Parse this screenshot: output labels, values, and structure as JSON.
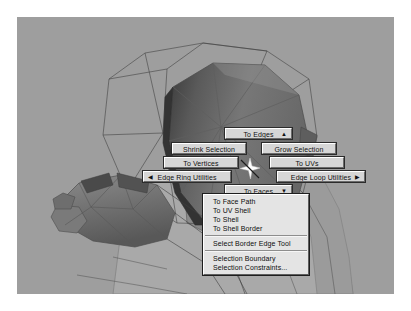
{
  "app": {
    "name": "Maya 3D Viewport",
    "viewport": {
      "background_color": "#9e9e9e",
      "model_description": "shaded polygon head and arm mesh with wireframe cage",
      "mesh_color": "#6e6e6e",
      "wire_color": "#3a3a3a"
    }
  },
  "marking_menu": {
    "title": "Edge marking menu",
    "center_cursor_icon": "sparkle-cursor-icon",
    "buttons": [
      {
        "id": "to-edges",
        "label": "To Edges",
        "arrow": "▲",
        "arrow_side": "right"
      },
      {
        "id": "shrink",
        "label": "Shrink Selection",
        "arrow": "",
        "arrow_side": ""
      },
      {
        "id": "grow",
        "label": "Grow Selection",
        "arrow": "",
        "arrow_side": ""
      },
      {
        "id": "to-vertices",
        "label": "To Vertices",
        "arrow": "",
        "arrow_side": ""
      },
      {
        "id": "to-uvs",
        "label": "To UVs",
        "arrow": "",
        "arrow_side": ""
      },
      {
        "id": "edge-ring",
        "label": "Edge Ring Utilities",
        "arrow": "◀",
        "arrow_side": "left"
      },
      {
        "id": "edge-loop",
        "label": "Edge Loop Utilities",
        "arrow": "▶",
        "arrow_side": "right"
      },
      {
        "id": "to-faces",
        "label": "To Faces",
        "arrow": "▼",
        "arrow_side": "right"
      }
    ]
  },
  "submenu": {
    "parent_label": "To Faces",
    "items": [
      {
        "label": "To Face Path",
        "separator_after": false
      },
      {
        "label": "To UV Shell",
        "separator_after": false
      },
      {
        "label": "To Shell",
        "separator_after": false
      },
      {
        "label": "To Shell Border",
        "separator_after": true
      },
      {
        "label": "Select Border Edge Tool",
        "separator_after": true
      },
      {
        "label": "Selection Boundary",
        "separator_after": false
      },
      {
        "label": "Selection Constraints...",
        "separator_after": false
      }
    ]
  },
  "colors": {
    "menu_face": "#d6d6d6",
    "panel_face": "#e4e4e4",
    "text": "#0d0d0d",
    "viewport_bg": "#9e9e9e",
    "page_bg": "#ffffff"
  }
}
